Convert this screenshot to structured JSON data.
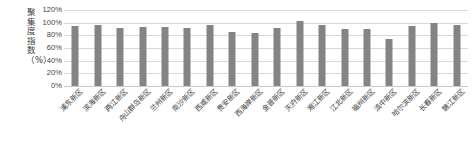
{
  "chart_data": {
    "type": "bar",
    "title": "",
    "xlabel": "",
    "ylabel": "聚集度指数（%）",
    "ylim": [
      0,
      120
    ],
    "ytick_labels": [
      "120%",
      "100%",
      "80%",
      "60%",
      "40%",
      "20%",
      "0%"
    ],
    "ytick_values": [
      120,
      100,
      80,
      60,
      40,
      20,
      0
    ],
    "grid": true,
    "legend": false,
    "bar_color": "#848484",
    "gridline_color": "#d8d8d8",
    "categories": [
      "浦东新区",
      "滨海新区",
      "两江新区",
      "舟山群岛新区",
      "兰州新区",
      "南沙新区",
      "西咸新区",
      "贵安新区",
      "西海岸新区",
      "金普新区",
      "天府新区",
      "湘江新区",
      "江北新区",
      "福州新区",
      "滇中新区",
      "哈尔滨新区",
      "长春新区",
      "赣江新区"
    ],
    "values": [
      94,
      97,
      92,
      93,
      93,
      92,
      96,
      85,
      84,
      92,
      102,
      97,
      90,
      90,
      75,
      95,
      99,
      96
    ]
  }
}
